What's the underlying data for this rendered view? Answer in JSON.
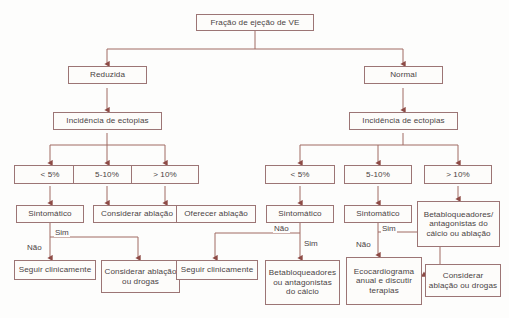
{
  "diagram": {
    "colors": {
      "border": "#9c7575",
      "connector": "#a06a63",
      "text": "#4a4344",
      "background": "#fdfdfc"
    }
  },
  "nodes": {
    "root": "Fração de ejeção de VE",
    "left_branch": "Reduzida",
    "right_branch": "Normal",
    "left_ectopy": "Incidência de ectopias",
    "right_ectopy": "Incidência de ectopias",
    "l_pct_low": "< 5%",
    "l_pct_mid": "5-10%",
    "l_pct_high": "> 10%",
    "r_pct_low": "< 5%",
    "r_pct_mid": "5-10%",
    "r_pct_high": "> 10%",
    "l_symptomatic": "Sintomático",
    "l_consider_ablation": "Considerar ablação",
    "l_offer_ablation": "Oferecer ablação",
    "r_symptomatic_low": "Sintomático",
    "r_symptomatic_mid": "Sintomático",
    "r_betablockers_ablation": "Betabloqueadores/ antagonistas do cálcio ou ablação",
    "l_follow_clinically": "Seguir clinicamente",
    "l_consider_ablation_drugs": "Considerar ablação ou drogas",
    "r_follow_clinically": "Seguir clinicamente",
    "r_betablockers_calcium": "Betabloqueadores ou antagonistas do cálcio",
    "r_echo_annual": "Ecocardiograma anual e discutir terapias",
    "r_consider_ablation_drugs": "Considerar ablação ou drogas"
  },
  "edge_labels": {
    "l_yes": "Sim",
    "l_no": "Não",
    "r_low_no": "Não",
    "r_low_yes": "Sim",
    "r_mid_yes": "Sim",
    "r_mid_no": "Não"
  }
}
